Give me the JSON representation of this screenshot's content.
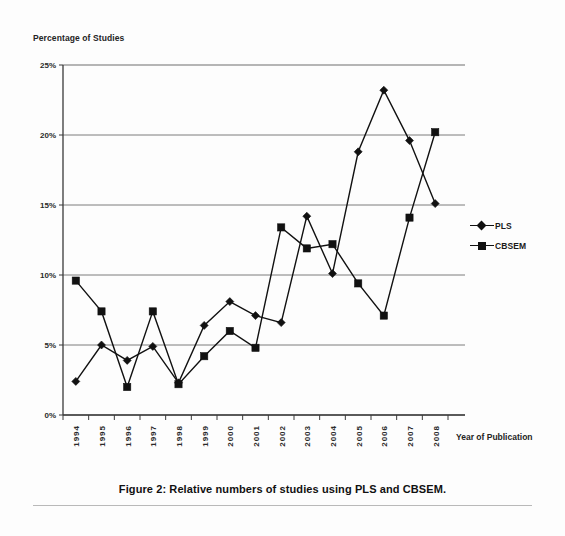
{
  "figure": {
    "caption": "Figure 2: Relative numbers of studies using PLS and CBSEM."
  },
  "chart_data": {
    "type": "line",
    "title": "",
    "subtitle": "",
    "ylabel": "Percentage of Studies",
    "xlabel": "Year of Publication",
    "categories": [
      "1994",
      "1995",
      "1996",
      "1997",
      "1998",
      "1999",
      "2000",
      "2001",
      "2002",
      "2003",
      "2004",
      "2005",
      "2006",
      "2007",
      "2008"
    ],
    "ylim": [
      0,
      25
    ],
    "yticks": [
      0,
      5,
      10,
      15,
      20,
      25
    ],
    "ytick_labels": [
      "0%",
      "5%",
      "10%",
      "15%",
      "20%",
      "25%"
    ],
    "grid": true,
    "grid_axis": "y",
    "legend_position": "right",
    "series": [
      {
        "name": "PLS",
        "marker": "diamond",
        "color": "#111111",
        "values": [
          2.4,
          5.0,
          3.9,
          4.9,
          2.3,
          6.4,
          8.1,
          7.1,
          6.6,
          14.2,
          10.1,
          18.8,
          23.2,
          19.6,
          15.1
        ]
      },
      {
        "name": "CBSEM",
        "marker": "square",
        "color": "#111111",
        "values": [
          9.6,
          7.4,
          2.0,
          7.4,
          2.2,
          4.2,
          6.0,
          4.8,
          13.4,
          11.9,
          12.2,
          9.4,
          7.1,
          14.1,
          20.2
        ]
      }
    ]
  }
}
